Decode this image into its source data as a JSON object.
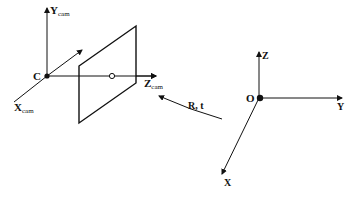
{
  "diagram": {
    "type": "camera-world-coordinate-frames",
    "camera_frame": {
      "origin_label": "C",
      "axes": [
        {
          "name": "Y",
          "subscript": "cam"
        },
        {
          "name": "X",
          "subscript": "cam"
        },
        {
          "name": "Z",
          "subscript": "cam"
        }
      ]
    },
    "image_plane": {
      "principal_point_marker": "circle"
    },
    "world_frame": {
      "origin_label": "O",
      "axes": [
        {
          "name": "Z"
        },
        {
          "name": "Y"
        },
        {
          "name": "X"
        }
      ]
    },
    "transform": {
      "label": "R, t"
    },
    "colors": {
      "line": "#111111",
      "background": "#ffffff"
    }
  }
}
